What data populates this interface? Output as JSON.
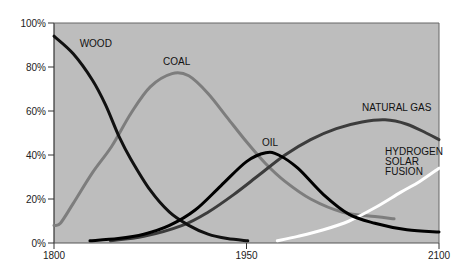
{
  "chart_data": {
    "type": "line",
    "title": "",
    "xlabel": "",
    "ylabel": "",
    "xlim": [
      1800,
      2100
    ],
    "ylim": [
      0,
      100
    ],
    "grid": false,
    "x_ticks": [
      1800,
      1950,
      2100
    ],
    "y_ticks": [
      {
        "value": 0,
        "label": "0%"
      },
      {
        "value": 20,
        "label": "20%"
      },
      {
        "value": 40,
        "label": "40%"
      },
      {
        "value": 60,
        "label": "60%"
      },
      {
        "value": 80,
        "label": "80%"
      },
      {
        "value": 100,
        "label": "100%"
      }
    ],
    "background_color": "#bdbdbd",
    "series": [
      {
        "name": "WOOD",
        "label_lines": [
          "WOOD"
        ],
        "color": "#111111",
        "points": [
          [
            1800,
            94
          ],
          [
            1815,
            86
          ],
          [
            1830,
            74
          ],
          [
            1840,
            63
          ],
          [
            1851,
            48
          ],
          [
            1860,
            38
          ],
          [
            1875,
            24
          ],
          [
            1890,
            14
          ],
          [
            1905,
            8
          ],
          [
            1920,
            4
          ],
          [
            1935,
            2
          ],
          [
            1951,
            1
          ]
        ]
      },
      {
        "name": "COAL",
        "label_lines": [
          "COAL"
        ],
        "color": "#7d7d7d",
        "points": [
          [
            1800,
            8
          ],
          [
            1805,
            9
          ],
          [
            1815,
            18
          ],
          [
            1830,
            32
          ],
          [
            1845,
            44
          ],
          [
            1860,
            59
          ],
          [
            1875,
            71
          ],
          [
            1892,
            77
          ],
          [
            1905,
            76
          ],
          [
            1920,
            68
          ],
          [
            1935,
            57
          ],
          [
            1950,
            46
          ],
          [
            1965,
            36
          ],
          [
            1980,
            28
          ],
          [
            2000,
            20
          ],
          [
            2025,
            14
          ],
          [
            2050,
            12
          ],
          [
            2065,
            11
          ]
        ]
      },
      {
        "name": "OIL",
        "label_lines": [
          "OIL"
        ],
        "color": "#000000",
        "points": [
          [
            1828,
            1
          ],
          [
            1850,
            2
          ],
          [
            1870,
            4
          ],
          [
            1890,
            8
          ],
          [
            1910,
            15
          ],
          [
            1930,
            26
          ],
          [
            1950,
            37
          ],
          [
            1965,
            41
          ],
          [
            1975,
            40
          ],
          [
            1990,
            34
          ],
          [
            2010,
            22
          ],
          [
            2030,
            13
          ],
          [
            2050,
            9
          ],
          [
            2075,
            6
          ],
          [
            2100,
            5
          ]
        ]
      },
      {
        "name": "NATURAL GAS",
        "label_lines": [
          "NATURAL GAS"
        ],
        "color": "#3c3c3c",
        "points": [
          [
            1844,
            1
          ],
          [
            1870,
            3
          ],
          [
            1900,
            8
          ],
          [
            1920,
            14
          ],
          [
            1940,
            22
          ],
          [
            1960,
            31
          ],
          [
            1980,
            40
          ],
          [
            2000,
            47
          ],
          [
            2020,
            52
          ],
          [
            2040,
            55
          ],
          [
            2058,
            56
          ],
          [
            2075,
            54
          ],
          [
            2090,
            50
          ],
          [
            2100,
            47
          ]
        ]
      },
      {
        "name": "HYDROGEN SOLAR FUSION",
        "label_lines": [
          "HYDROGEN",
          "SOLAR",
          "FUSION"
        ],
        "color": "#ffffff",
        "points": [
          [
            1974,
            1
          ],
          [
            1990,
            3
          ],
          [
            2010,
            6
          ],
          [
            2030,
            10
          ],
          [
            2050,
            16
          ],
          [
            2070,
            23
          ],
          [
            2085,
            28
          ],
          [
            2100,
            34
          ]
        ]
      }
    ],
    "annotations": [
      {
        "series": "WOOD",
        "at": [
          1820,
          89
        ]
      },
      {
        "series": "COAL",
        "at": [
          1885,
          81
        ]
      },
      {
        "series": "OIL",
        "at": [
          1962,
          44
        ]
      },
      {
        "series": "NATURAL GAS",
        "at": [
          2040,
          60
        ]
      },
      {
        "series": "HYDROGEN SOLAR FUSION",
        "at": [
          2058,
          40
        ]
      }
    ]
  }
}
